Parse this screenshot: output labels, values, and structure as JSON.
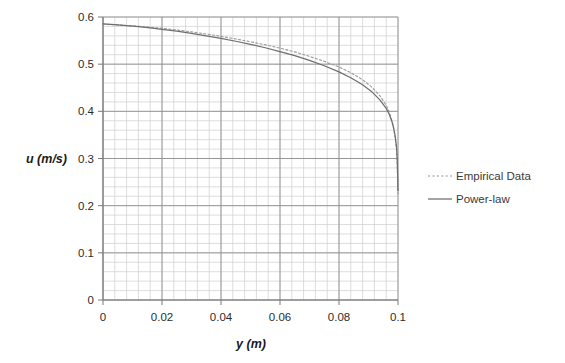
{
  "chart_data": {
    "type": "line",
    "title": "",
    "xlabel": "y (m)",
    "ylabel": "u (m/s)",
    "xlim": [
      0,
      0.1
    ],
    "ylim": [
      0,
      0.6
    ],
    "xticks": [
      "0",
      "0.02",
      "0.04",
      "0.06",
      "0.08",
      "0.1"
    ],
    "xtick_values": [
      0,
      0.02,
      0.04,
      0.06,
      0.08,
      0.1
    ],
    "yticks": [
      "0",
      "0.1",
      "0.2",
      "0.3",
      "0.4",
      "0.5",
      "0.6"
    ],
    "ytick_values": [
      0,
      0.1,
      0.2,
      0.3,
      0.4,
      0.5,
      0.6
    ],
    "grid": "major and minor gridlines, x minor every 0.004, y minor every 0.02",
    "legend_position": "right",
    "series": [
      {
        "name": "Empirical Data",
        "style": "dotted",
        "color": "#9a9a9a",
        "x": [
          0,
          0.004,
          0.008,
          0.012,
          0.016,
          0.02,
          0.025,
          0.03,
          0.035,
          0.04,
          0.045,
          0.05,
          0.055,
          0.06,
          0.065,
          0.07,
          0.075,
          0.08,
          0.084,
          0.088,
          0.091,
          0.094,
          0.096,
          0.097,
          0.098,
          0.0985,
          0.099,
          0.0995,
          0.09975,
          0.1
        ],
        "y": [
          0.585,
          0.5835,
          0.582,
          0.5805,
          0.5785,
          0.576,
          0.5725,
          0.5685,
          0.564,
          0.559,
          0.5535,
          0.5475,
          0.541,
          0.534,
          0.526,
          0.5165,
          0.506,
          0.494,
          0.482,
          0.467,
          0.452,
          0.432,
          0.413,
          0.399,
          0.379,
          0.365,
          0.346,
          0.318,
          0.286,
          0.225
        ]
      },
      {
        "name": "Power-law",
        "style": "solid",
        "color": "#6e6e6e",
        "x": [
          0,
          0.004,
          0.008,
          0.012,
          0.016,
          0.02,
          0.025,
          0.03,
          0.035,
          0.04,
          0.045,
          0.05,
          0.055,
          0.06,
          0.065,
          0.07,
          0.075,
          0.08,
          0.084,
          0.088,
          0.091,
          0.094,
          0.096,
          0.097,
          0.098,
          0.0985,
          0.099,
          0.0995,
          0.09975,
          0.1
        ],
        "y": [
          0.5855,
          0.5838,
          0.5818,
          0.5795,
          0.577,
          0.574,
          0.5698,
          0.5652,
          0.5602,
          0.5546,
          0.5486,
          0.542,
          0.5348,
          0.5268,
          0.518,
          0.508,
          0.4966,
          0.4836,
          0.4712,
          0.4562,
          0.4422,
          0.4232,
          0.4062,
          0.3942,
          0.3772,
          0.3652,
          0.3492,
          0.3252,
          0.2982,
          0.232
        ]
      }
    ]
  },
  "legend": {
    "items": [
      {
        "label": "Empirical Data",
        "marker": "dotted-line-swatch"
      },
      {
        "label": "Power-law",
        "marker": "solid-line-swatch"
      }
    ]
  },
  "axes": {
    "x_title": "y (m)",
    "y_title": "u (m/s)"
  }
}
